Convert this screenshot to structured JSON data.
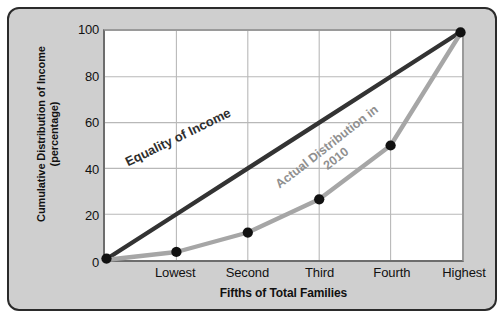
{
  "chart_data": {
    "type": "line",
    "title": "",
    "xlabel": "Fifths of Total Families",
    "ylabel_line1": "Cumulative Distribution of Income",
    "ylabel_line2": "(percentage)",
    "categories": [
      "Lowest",
      "Second",
      "Third",
      "Fourth",
      "Highest"
    ],
    "ylim": [
      0,
      100
    ],
    "yticks": [
      0,
      20,
      40,
      60,
      80,
      100
    ],
    "grid": true,
    "legend_position": "inline-annotation",
    "series": [
      {
        "name": "Equality of Income",
        "color": "#333333",
        "values": [
          20,
          40,
          60,
          80,
          100
        ],
        "origin_value": 0,
        "markers": false,
        "annotation_line1": "Equality of Income",
        "annotation_line2": ""
      },
      {
        "name": "Actual Distribution in 2010",
        "color": "#a6a6a6",
        "values": [
          3.5,
          12,
          26.5,
          50,
          100
        ],
        "origin_value": 0,
        "markers": true,
        "annotation_line1": "Actual Distribution in",
        "annotation_line2": "2010"
      }
    ]
  },
  "colors": {
    "panel_background": "#cfcfcf",
    "panel_border": "#2b2b2b",
    "plot_background": "#ffffff",
    "grid": "#b8b8b8",
    "axis": "#6d6d6d",
    "equality_line": "#333333",
    "actual_line": "#a6a6a6",
    "marker": "#111111",
    "text": "#111111"
  }
}
